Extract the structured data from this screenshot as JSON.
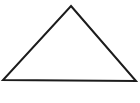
{
  "figure": {
    "name": "triangle-figure",
    "shape_label": "triangle",
    "canvas": {
      "width": 140,
      "height": 103,
      "background_color": "#ffffff"
    },
    "style": {
      "stroke_color": "#1c1c1c",
      "stroke_width": 2,
      "fill_color": "none"
    },
    "vertices": [
      {
        "name": "apex",
        "x": 71,
        "y": 6
      },
      {
        "name": "bottom-right",
        "x": 136,
        "y": 81
      },
      {
        "name": "bottom-left",
        "x": 3,
        "y": 80
      }
    ],
    "points_attr": "71,6 136,81 3,80"
  }
}
